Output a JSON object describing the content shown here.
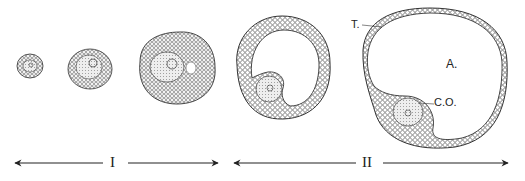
{
  "figure": {
    "title": "",
    "labels": {
      "theca": "T.",
      "antrum": "A.",
      "cumulus_oophorus": "C.O."
    },
    "stages": [
      {
        "id": "I",
        "label": "I"
      },
      {
        "id": "II",
        "label": "II"
      }
    ],
    "follicles": [
      {
        "name": "follicle-1",
        "stage": "I"
      },
      {
        "name": "follicle-2",
        "stage": "I"
      },
      {
        "name": "follicle-3",
        "stage": "I"
      },
      {
        "name": "follicle-4",
        "stage": "II"
      },
      {
        "name": "follicle-5",
        "stage": "II"
      }
    ],
    "colors": {
      "ink": "#222222",
      "background": "#ffffff",
      "stipple": "#bbbbbb"
    }
  }
}
